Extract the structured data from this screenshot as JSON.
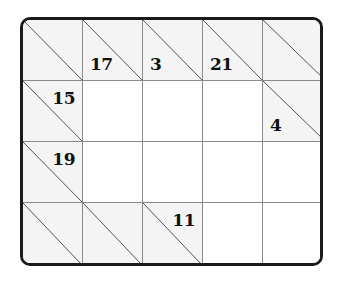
{
  "puzzle": {
    "type": "kakuro",
    "rows": 4,
    "cols": 5,
    "colors": {
      "border": "#1a1a1a",
      "clue_bg": "#f4f4f4",
      "white_bg": "#ffffff",
      "grid_line": "#8a8a8a"
    },
    "cells": [
      [
        {
          "kind": "clue"
        },
        {
          "kind": "clue",
          "down": "17"
        },
        {
          "kind": "clue",
          "down": "3"
        },
        {
          "kind": "clue",
          "down": "21"
        },
        {
          "kind": "clue"
        }
      ],
      [
        {
          "kind": "clue",
          "across": "15"
        },
        {
          "kind": "white",
          "value": ""
        },
        {
          "kind": "white",
          "value": ""
        },
        {
          "kind": "white",
          "value": ""
        },
        {
          "kind": "clue",
          "down": "4"
        }
      ],
      [
        {
          "kind": "clue",
          "across": "19"
        },
        {
          "kind": "white",
          "value": ""
        },
        {
          "kind": "white",
          "value": ""
        },
        {
          "kind": "white",
          "value": ""
        },
        {
          "kind": "white",
          "value": ""
        }
      ],
      [
        {
          "kind": "clue"
        },
        {
          "kind": "clue"
        },
        {
          "kind": "clue",
          "across": "11"
        },
        {
          "kind": "white",
          "value": ""
        },
        {
          "kind": "white",
          "value": ""
        }
      ]
    ]
  }
}
